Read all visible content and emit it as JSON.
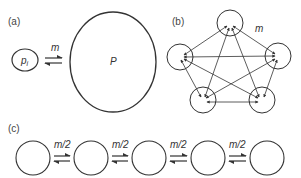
{
  "panel_a": {
    "label": "(a)",
    "small_pop_label": "p",
    "small_pop_sub": "i",
    "migration_label": "m",
    "large_pop_label": "P"
  },
  "panel_b": {
    "label": "(b)",
    "migration_label": "m",
    "num_demes": 5
  },
  "panel_c": {
    "label": "(c)",
    "migration_labels": [
      "m/2",
      "m/2",
      "m/2",
      "m/2"
    ],
    "num_demes": 5
  },
  "colors": {
    "stroke": "#333333",
    "text": "#444444",
    "background": "#ffffff"
  }
}
